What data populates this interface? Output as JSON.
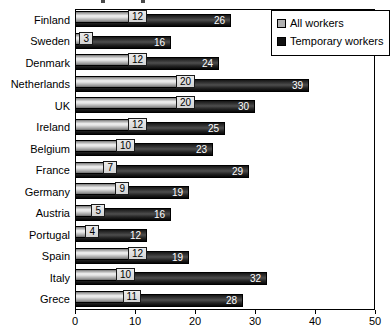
{
  "chart_data": {
    "type": "bar",
    "orientation": "horizontal",
    "categories": [
      "Finland",
      "Sweden",
      "Denmark",
      "Netherlands",
      "UK",
      "Ireland",
      "Belgium",
      "France",
      "Germany",
      "Austria",
      "Portugal",
      "Spain",
      "Italy",
      "Grece"
    ],
    "series": [
      {
        "name": "All workers",
        "values": [
          12,
          3,
          12,
          20,
          20,
          12,
          10,
          7,
          9,
          5,
          4,
          12,
          10,
          11
        ],
        "color": "#b0b0b0",
        "label_style": "boxed-black-text"
      },
      {
        "name": "Temporary workers",
        "values": [
          26,
          16,
          24,
          39,
          30,
          25,
          23,
          29,
          19,
          16,
          12,
          19,
          32,
          28
        ],
        "color": "#1a1a1a",
        "label_style": "white-text-inside"
      }
    ],
    "xlim": [
      0,
      50
    ],
    "x_ticks": [
      "0",
      "10",
      "20",
      "30",
      "40",
      "50"
    ],
    "grid": false,
    "value_labels": true,
    "legend_position": "top-right",
    "plot_border_color": "#000000",
    "background_color": "#ffffff"
  }
}
